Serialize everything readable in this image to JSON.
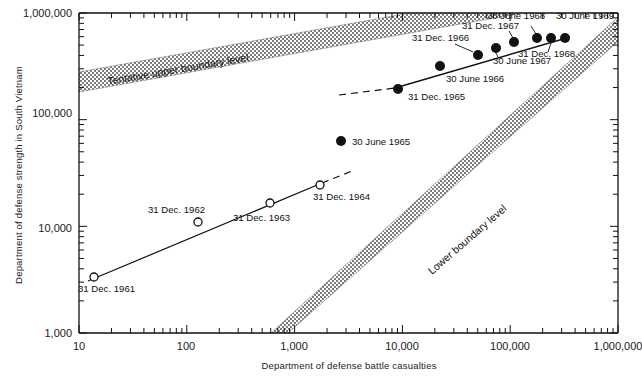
{
  "chart_data": {
    "type": "scatter",
    "title": "",
    "xlabel": "Department of defense battle casualties",
    "ylabel": "Department of defense strength in South Vietnam",
    "xscale": "log",
    "yscale": "log",
    "xlim": [
      10,
      1000000
    ],
    "ylim": [
      1000,
      1000000
    ],
    "grid": false,
    "legend": "none",
    "xticklabels": [
      "10",
      "100",
      "1,000",
      "10,000",
      "100,000",
      "1,000,000"
    ],
    "yticklabels": [
      "1,000",
      "10,000",
      "100,000",
      "1,000,000"
    ],
    "annotations": [
      {
        "name": "upper-boundary-band-label",
        "text": "Tentative upper boundary level"
      },
      {
        "name": "lower-boundary-band-label",
        "text": "Lower boundary level"
      }
    ],
    "series": [
      {
        "name": "Early period (open circles)",
        "marker": "open-circle",
        "points": [
          {
            "label": "31 Dec. 1961",
            "x": 13,
            "y": 3800
          },
          {
            "label": "31 Dec. 1962",
            "x": 150,
            "y": 11000
          },
          {
            "label": "31 Dec. 1963",
            "x": 620,
            "y": 16500
          },
          {
            "label": "31 Dec. 1964",
            "x": 1800,
            "y": 23000
          }
        ]
      },
      {
        "name": "Later period (filled circles)",
        "marker": "filled-circle",
        "points": [
          {
            "label": "30 June 1965",
            "x": 3000,
            "y": 60000
          },
          {
            "label": "31 Dec. 1965",
            "x": 9500,
            "y": 190000
          },
          {
            "label": "30 June 1966",
            "x": 24000,
            "y": 270000
          },
          {
            "label": "31 Dec. 1966",
            "x": 47000,
            "y": 380000
          },
          {
            "label": "30 June 1967",
            "x": 68000,
            "y": 450000
          },
          {
            "label": "31 Dec. 1967",
            "x": 110000,
            "y": 500000
          },
          {
            "label": "30 June 1968",
            "x": 190000,
            "y": 540000
          },
          {
            "label": "31 Dec. 1968",
            "x": 250000,
            "y": 545000
          },
          {
            "label": "30 June 1969",
            "x": 330000,
            "y": 545000
          }
        ]
      }
    ]
  },
  "axes": {
    "x_title": "Department of defense battle casualties",
    "y_title": "Department of defense strength in South Vietnam",
    "x_ticks": [
      "10",
      "100",
      "1,000",
      "10,000",
      "100,000",
      "1,000,000"
    ],
    "y_ticks": [
      "1,000",
      "10,000",
      "100,000",
      "1,000,000"
    ]
  },
  "bands": {
    "upper": "Tentative upper boundary level",
    "lower": "Lower boundary level"
  },
  "point_labels": {
    "p1961": "31 Dec. 1961",
    "p1962": "31 Dec. 1962",
    "p1963": "31 Dec. 1963",
    "p1964": "31 Dec. 1964",
    "jun1965": "30 June 1965",
    "dec1965": "31 Dec. 1965",
    "jun1966": "30 June 1966",
    "dec1966": "31 Dec. 1966",
    "jun1967": "30 June 1967",
    "dec1967": "31 Dec. 1967",
    "jun1968": "30 June 1968",
    "dec1968": "31 Dec. 1968",
    "jun1969": "30 June 1969"
  },
  "colors": {
    "ink": "#111111",
    "band": "#8a8a8a",
    "background": "#ffffff"
  }
}
